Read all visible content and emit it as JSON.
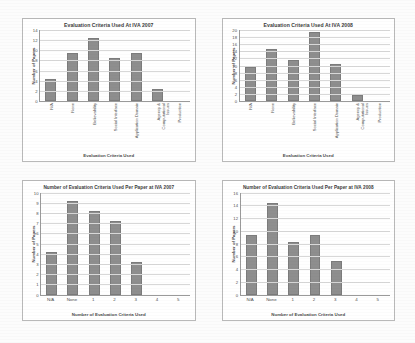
{
  "page": {
    "background_color": "#fcfcfc",
    "panel_background": "#ffffff",
    "panel_border_color": "#b9b9b9",
    "bar_color": "#8e8e8e",
    "gridline_color": "#d8d8d8",
    "axis_color": "#9a9a9a"
  },
  "chart_data": [
    {
      "id": "eval-criteria-2007",
      "type": "bar",
      "title": "Evaluation Criteria Used At IVA 2007",
      "xlabel": "Evaluation Criteria Used",
      "ylabel": "Number of Papers",
      "categories": [
        "N/A",
        "None",
        "Believability",
        "Social Interface",
        "Application Domain",
        "Agency & Computational Issues",
        "Production"
      ],
      "values": [
        4,
        9,
        12,
        8,
        9,
        2,
        0
      ],
      "ylim": [
        0,
        14
      ],
      "yticks": [
        0,
        2,
        4,
        6,
        8,
        10,
        12,
        14
      ],
      "grid": true,
      "legend": "none"
    },
    {
      "id": "eval-criteria-2008",
      "type": "bar",
      "title": "Evaluation Criteria Used At IVA 2008",
      "xlabel": "Evaluation Criteria Used",
      "ylabel": "Number of Papers",
      "categories": [
        "N/A",
        "None",
        "Believability",
        "Social Interface",
        "Application Domain",
        "Agency & Computational Issues",
        "Production"
      ],
      "values": [
        9,
        14,
        11,
        19,
        10,
        1,
        0
      ],
      "ylim": [
        0,
        20
      ],
      "yticks": [
        0,
        2,
        4,
        6,
        8,
        10,
        12,
        14,
        16,
        18,
        20
      ],
      "grid": true,
      "legend": "none"
    },
    {
      "id": "criteria-per-paper-2007",
      "type": "bar",
      "title": "Number of Evaluation Criteria Used Per Paper at IVA 2007",
      "xlabel": "Number of Evaluation Criteria Used",
      "ylabel": "Number of Papers",
      "categories": [
        "N/A",
        "None",
        "1",
        "2",
        "3",
        "4",
        "5"
      ],
      "values": [
        4,
        9,
        8,
        7,
        3,
        0,
        0
      ],
      "ylim": [
        0,
        10
      ],
      "yticks": [
        0,
        1,
        2,
        3,
        4,
        5,
        6,
        7,
        8,
        9,
        10
      ],
      "grid": true,
      "legend": "none"
    },
    {
      "id": "criteria-per-paper-2008",
      "type": "bar",
      "title": "Number of Evaluation Criteria Used Per Paper at IVA 2008",
      "xlabel": "Number of Evaluation Criteria Used",
      "ylabel": "Number of Papers",
      "categories": [
        "N/A",
        "None",
        "1",
        "2",
        "3",
        "4",
        "5"
      ],
      "values": [
        9,
        14,
        8,
        9,
        5,
        0,
        0
      ],
      "ylim": [
        0,
        16
      ],
      "yticks": [
        0,
        2,
        4,
        6,
        8,
        10,
        12,
        14,
        16
      ],
      "grid": true,
      "legend": "none"
    }
  ]
}
